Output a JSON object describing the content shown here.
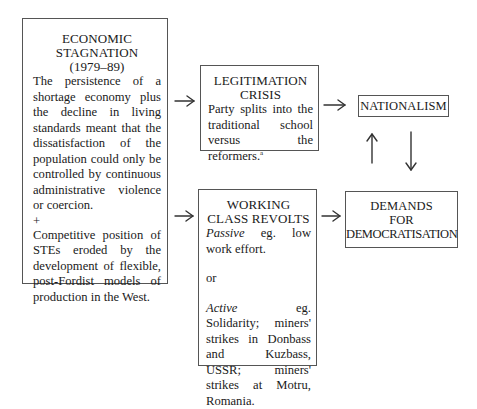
{
  "diagram": {
    "boxes": {
      "economic_stagnation": {
        "title_line1": "ECONOMIC",
        "title_line2": "STAGNATION",
        "title_line3": "(1979–89)",
        "text1": "The persistence of a shortage economy plus the decline in living standards meant that the dissatisfaction of the population could only be controlled by continuous administrative violence or coercion.",
        "plus": "+",
        "text2": "Competitive position of STEs eroded by the development of flexible, post-Fordist models of production in the West."
      },
      "legitimation_crisis": {
        "title_line1": "LEGITIMATION",
        "title_line2": "CRISIS",
        "text": "Party splits into the traditional school versus the reformers.",
        "footnote_marker": "a"
      },
      "working_class_revolts": {
        "title_line1": "WORKING",
        "title_line2": "CLASS REVOLTS",
        "passive_label": "Passive",
        "passive_text": " eg. low work effort.",
        "or": "or",
        "active_label": "Active",
        "active_text": " eg. Solidarity; miners' strikes in Donbass and Kuzbass, USSR; miners' strikes at Motru, Romania."
      },
      "nationalism": {
        "title": "NATIONALISM"
      },
      "demands_for_democratisation": {
        "title_line1": "DEMANDS",
        "title_line2": "FOR",
        "title_line3": "DEMOCRATISATION"
      }
    },
    "edges": [
      {
        "from": "economic_stagnation",
        "to": "legitimation_crisis",
        "type": "arrow"
      },
      {
        "from": "economic_stagnation",
        "to": "working_class_revolts",
        "type": "arrow"
      },
      {
        "from": "legitimation_crisis",
        "to": "nationalism",
        "type": "arrow"
      },
      {
        "from": "working_class_revolts",
        "to": "demands_for_democratisation",
        "type": "arrow"
      },
      {
        "from": "demands_for_democratisation",
        "to": "nationalism",
        "type": "arrow"
      },
      {
        "from": "nationalism",
        "to": "demands_for_democratisation",
        "type": "arrow"
      }
    ],
    "colors": {
      "line": "#333333",
      "border": "#555555",
      "text": "#1a1a1a",
      "background": "#ffffff"
    }
  }
}
